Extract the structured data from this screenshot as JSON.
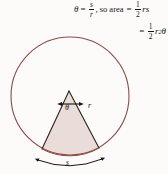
{
  "figure": {
    "type": "geometry-diagram",
    "colors": {
      "circle_stroke": "#8a4a46",
      "sector_fill": "#e9dcd9",
      "sector_stroke": "#2a2320",
      "text": "#1a1512",
      "background": "#fcfbfa"
    },
    "formula": {
      "line1": {
        "lhs_symbol": "θ",
        "equals": "=",
        "fraction_numerator": "s",
        "fraction_denominator": "r",
        "comma": ",",
        "connector": "so area",
        "equals2": "=",
        "coef_numerator": "1",
        "coef_denominator": "2",
        "expression": "rs"
      },
      "line2": {
        "equals": "=",
        "coef_numerator": "1",
        "coef_denominator": "2",
        "base": "r",
        "exponent": "2",
        "angle": "θ"
      }
    },
    "labels": {
      "theta_angle": "θ",
      "radius": "r",
      "arc_length": "s"
    },
    "geometry": {
      "circle_center_x": 70,
      "circle_center_y": 96,
      "circle_radius": 59,
      "sector_apex_x": 69,
      "sector_apex_y": 91,
      "sector_left_x": 42,
      "sector_left_y": 149,
      "sector_right_x": 99,
      "sector_right_y": 148
    }
  }
}
